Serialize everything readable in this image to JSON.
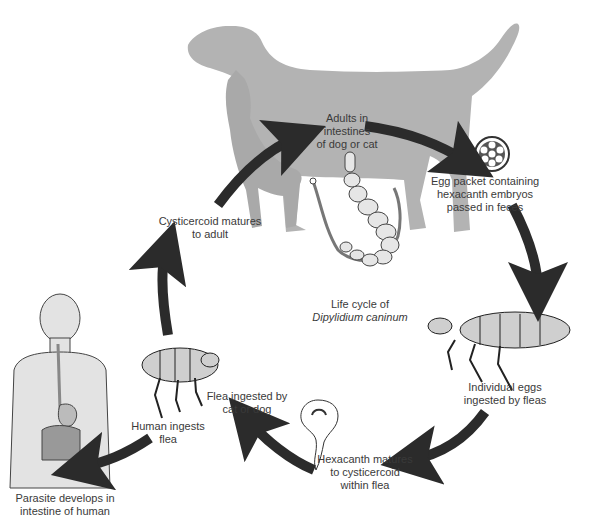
{
  "diagram": {
    "title_line1": "Life cycle of",
    "title_line2": "Dipylidium caninum",
    "colors": {
      "silhouette": "#b3b3b3",
      "arrow": "#2b2b2b",
      "human_fill": "#e3e3e3",
      "flea_fill": "#cfcfcf",
      "text": "#3a3a3a"
    },
    "stages": [
      {
        "id": "adults",
        "lines": [
          "Adults in",
          "intestines",
          "of dog or cat"
        ]
      },
      {
        "id": "egg-packet",
        "lines": [
          "Egg packet containing",
          "hexacanth embryos",
          "passed in feces"
        ]
      },
      {
        "id": "eggs-ingested",
        "lines": [
          "Individual eggs",
          "ingested by fleas"
        ]
      },
      {
        "id": "hexacanth-matures",
        "lines": [
          "Hexacanth matures",
          "to cysticercoid",
          "within flea"
        ]
      },
      {
        "id": "flea-ingested",
        "lines": [
          "Flea ingested by",
          "cat or dog"
        ]
      },
      {
        "id": "human-ingests",
        "lines": [
          "Human ingests",
          "flea"
        ]
      },
      {
        "id": "human-intestine",
        "lines": [
          "Parasite develops in",
          "intestine of human"
        ]
      },
      {
        "id": "cysticercoid-matures",
        "lines": [
          "Cysticercoid matures",
          "to adult"
        ]
      }
    ],
    "illustrations": [
      "dog-cat-silhouette-icon",
      "tapeworm-icon",
      "egg-packet-icon",
      "flea-icon",
      "hexacanth-larva-icon",
      "human-body-icon"
    ]
  }
}
